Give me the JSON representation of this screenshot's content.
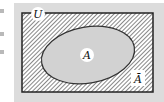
{
  "diagram": {
    "type": "venn",
    "universe_label": "U",
    "set_label": "A",
    "complement_label": "Ā",
    "colors": {
      "panel": "#dcdcdc",
      "set_fill": "#d2d2d2",
      "hatch": "#555555",
      "border": "#222222",
      "label_bg": "#ffffff"
    }
  }
}
